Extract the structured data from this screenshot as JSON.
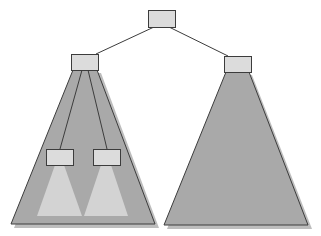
{
  "diagram": {
    "type": "tree",
    "colors": {
      "background": "#ffffff",
      "subtree_fill": "#a9a9a9",
      "subtree_shadow": "#b9b9b9",
      "inner_subtree_fill": "#d2d2d2",
      "node_fill": "#dcdcdc",
      "stroke": "#3c3c3c"
    },
    "nodes": [
      {
        "id": "root",
        "label": ""
      },
      {
        "id": "left-child",
        "label": ""
      },
      {
        "id": "right-child",
        "label": ""
      },
      {
        "id": "left-grandchild-1",
        "label": ""
      },
      {
        "id": "left-grandchild-2",
        "label": ""
      }
    ],
    "edges": [
      {
        "from": "root",
        "to": "left-child"
      },
      {
        "from": "root",
        "to": "right-child"
      },
      {
        "from": "left-child",
        "to": "left-grandchild-1"
      },
      {
        "from": "left-child",
        "to": "left-grandchild-2"
      }
    ],
    "subtrees": [
      {
        "id": "left-subtree",
        "under": "left-child"
      },
      {
        "id": "right-subtree",
        "under": "right-child"
      },
      {
        "id": "inner-subtree-1",
        "under": "left-grandchild-1"
      },
      {
        "id": "inner-subtree-2",
        "under": "left-grandchild-2"
      }
    ]
  }
}
